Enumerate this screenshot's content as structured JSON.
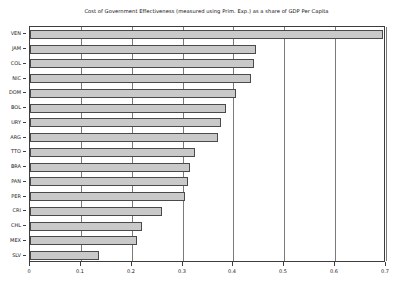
{
  "chart_data": {
    "type": "bar",
    "orientation": "horizontal",
    "title": "Cost of Government Effectiveness (measured using Prim. Exp.) as a share of GDP Per Capita",
    "xlabel": "",
    "ylabel": "",
    "xlim": [
      0,
      0.7
    ],
    "ylim": null,
    "grid": true,
    "grid_axis": "x",
    "legend": null,
    "legend_position": "none",
    "categories": [
      "VEN",
      "JAM",
      "COL",
      "NIC",
      "DOM",
      "BOL",
      "URY",
      "ARG",
      "TTO",
      "BRA",
      "PAN",
      "PER",
      "CRI",
      "CHL",
      "MEX",
      "SLV"
    ],
    "values": [
      0.695,
      0.445,
      0.44,
      0.435,
      0.405,
      0.385,
      0.375,
      0.37,
      0.325,
      0.315,
      0.31,
      0.305,
      0.26,
      0.22,
      0.21,
      0.135
    ],
    "xticks": [
      0,
      0.1,
      0.2,
      0.3,
      0.4,
      0.5,
      0.6,
      0.7
    ],
    "xtick_labels": [
      "0",
      "0.1",
      "0.2",
      "0.3",
      "0.4",
      "0.5",
      "0.6",
      "0.7"
    ],
    "bar_color": "#c9c9c9",
    "bar_edge_color": "#4a4a4a",
    "axis_color": "#3d3d3d",
    "grid_color": "#7a7a7a",
    "background": "#ffffff"
  }
}
